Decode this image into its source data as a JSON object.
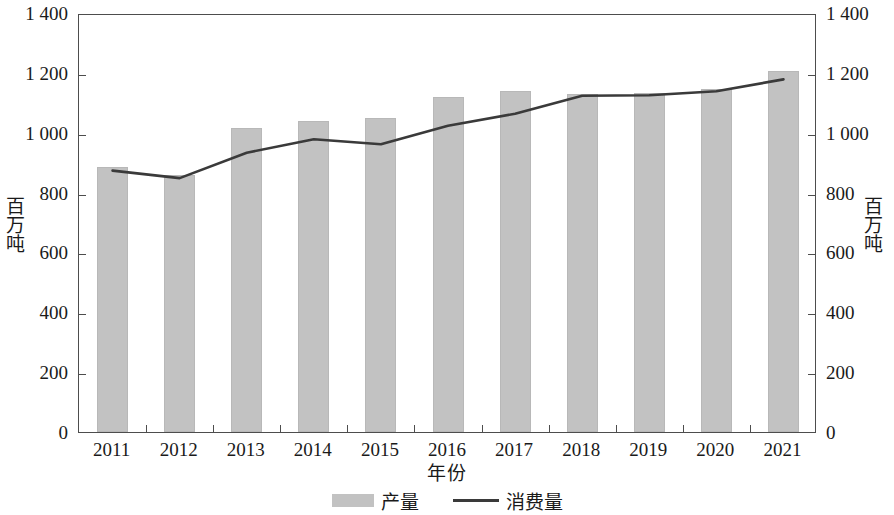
{
  "chart_data": {
    "type": "bar",
    "title": "",
    "subtitle": "",
    "xlabel": "年份",
    "ylabel": "百万吨",
    "ylabel_right": "百万吨",
    "categories": [
      "2011",
      "2012",
      "2013",
      "2014",
      "2015",
      "2016",
      "2017",
      "2018",
      "2019",
      "2020",
      "2021"
    ],
    "ylim": [
      0,
      1400
    ],
    "ytick_values": [
      0,
      200,
      400,
      600,
      800,
      1000,
      1200,
      1400
    ],
    "ytick_labels": [
      "0",
      "200",
      "400",
      "600",
      "800",
      "1 000",
      "1 200",
      "1 400"
    ],
    "ytick_labels_right": [
      "0",
      "200",
      "400",
      "600",
      "800",
      "1 000",
      "1 200",
      "1 400"
    ],
    "grid": false,
    "legend_position": "bottom",
    "series": [
      {
        "name": "产量",
        "type": "bar",
        "color": "#c2c2c2",
        "values": [
          885,
          860,
          1015,
          1040,
          1050,
          1120,
          1140,
          1130,
          1133,
          1145,
          1205
        ]
      },
      {
        "name": "消费量",
        "type": "line",
        "color": "#3a3a3a",
        "values": [
          880,
          855,
          940,
          985,
          968,
          1030,
          1070,
          1130,
          1132,
          1145,
          1185
        ]
      }
    ]
  },
  "legend": {
    "items": [
      {
        "label": "产量",
        "marker": "bar-swatch"
      },
      {
        "label": "消费量",
        "marker": "line-swatch"
      }
    ]
  }
}
